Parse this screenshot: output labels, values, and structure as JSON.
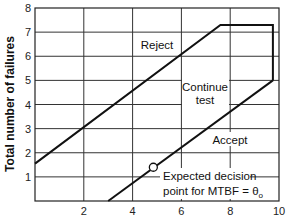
{
  "chart_data": {
    "type": "line",
    "title": "",
    "xlabel": "",
    "ylabel": "Total number of failures",
    "xlim": [
      0,
      10
    ],
    "ylim": [
      0,
      8
    ],
    "x_ticks": [
      2,
      4,
      6,
      8,
      10
    ],
    "y_ticks": [
      1,
      2,
      3,
      4,
      5,
      6,
      7,
      8
    ],
    "grid": true,
    "x_grid_step": 2,
    "y_grid_step": 1,
    "series": [
      {
        "name": "Reject boundary",
        "points": [
          [
            0,
            1.55
          ],
          [
            7.6,
            7.3
          ],
          [
            9.75,
            7.3
          ],
          [
            9.75,
            5.0
          ]
        ]
      },
      {
        "name": "Accept boundary",
        "points": [
          [
            3.0,
            0
          ],
          [
            9.75,
            5.0
          ]
        ]
      }
    ],
    "markers": [
      {
        "name": "Expected decision point",
        "x": 4.85,
        "y": 1.4,
        "shape": "open-circle"
      }
    ],
    "annotations": [
      {
        "text": "Reject",
        "x": 5.3,
        "y": 6.45
      },
      {
        "text": "Continue",
        "x": 7.1,
        "y": 4.7
      },
      {
        "text": "test",
        "x": 7.1,
        "y": 4.15
      },
      {
        "text": "Accept",
        "x": 8.0,
        "y": 2.45
      },
      {
        "text": "Expected decision",
        "x": 5.25,
        "y": 1.0
      },
      {
        "text": "point for MTBF = θ₀",
        "x": 5.25,
        "y": 0.38
      }
    ]
  },
  "labels": {
    "y_axis_title": "Total number of failures",
    "reject": "Reject",
    "continue_1": "Continue",
    "continue_2": "test",
    "accept": "Accept",
    "note_1": "Expected decision",
    "note_2_prefix": "point for MTBF = θ",
    "note_2_sub": "o"
  }
}
